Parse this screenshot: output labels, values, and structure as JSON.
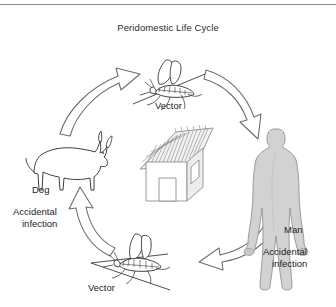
{
  "figure": {
    "title": "Peridomestic Life Cycle",
    "kind": "cycle-diagram",
    "background_color": "#ffffff",
    "rule_color": "#8a8a8a",
    "text_color": "#1d1d1d"
  },
  "nodes": [
    {
      "id": "vector-top",
      "label": "Vector",
      "icon": "sandfly-icon",
      "role": "insect vector",
      "position": "top-center"
    },
    {
      "id": "man",
      "label": "Man",
      "sublabel_line1": "Accidental",
      "sublabel_line2": "infection",
      "icon": "human-silhouette-icon",
      "fill_color": "#d2d2d2",
      "stroke_color": "#9a9a9a",
      "position": "right"
    },
    {
      "id": "vector-bottom",
      "label": "Vector",
      "icon": "sandfly-icon",
      "role": "insect vector",
      "position": "bottom-center"
    },
    {
      "id": "dog",
      "label": "Dog",
      "sublabel_line1": "Accidental",
      "sublabel_line2": "infection",
      "icon": "dog-outline-icon",
      "fill_color": "#ffffff",
      "stroke_color": "#4a4a4a",
      "position": "left"
    }
  ],
  "center": {
    "id": "hut",
    "icon": "thatched-hut-icon",
    "description": "thatched-roof dwelling",
    "roof_color": "#8c8c8c",
    "wall_color": "#ffffff",
    "wall_shade_color": "#ededed"
  },
  "arrows": [
    {
      "id": "arrow-dog-to-vector-top",
      "from": "dog",
      "to": "vector-top",
      "direction": "clockwise"
    },
    {
      "id": "arrow-vector-top-to-man",
      "from": "vector-top",
      "to": "man",
      "direction": "clockwise"
    },
    {
      "id": "arrow-man-to-vector-bottom",
      "from": "man",
      "to": "vector-bottom",
      "direction": "clockwise"
    },
    {
      "id": "arrow-vector-bottom-to-dog",
      "from": "vector-bottom",
      "to": "dog",
      "direction": "clockwise"
    }
  ]
}
